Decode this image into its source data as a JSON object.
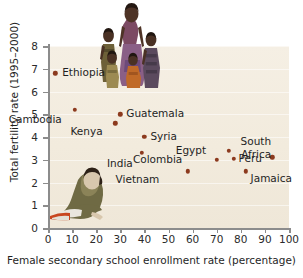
{
  "chart_data": {
    "type": "scatter",
    "title": "",
    "xlabel": "Female secondary school enrollment rate (percentage)",
    "ylabel": "Total fertility rate (1995–2000)",
    "xlim": [
      0,
      100
    ],
    "ylim": [
      0,
      8
    ],
    "xticks": [
      "0",
      "10",
      "20",
      "30",
      "40",
      "50",
      "60",
      "70",
      "80",
      "90",
      "100"
    ],
    "yticks": [
      "0",
      "1",
      "2",
      "3",
      "4",
      "5",
      "6",
      "7",
      "8"
    ],
    "grid": true,
    "legend": "none",
    "marker_color": "#8c3a1e",
    "plot_background": "#f3ece0",
    "points": [
      {
        "label": "Ethiopia",
        "x": 3,
        "y": 6.8,
        "label_dx": 7,
        "label_dy": -6
      },
      {
        "label": "Cambodia",
        "x": 11,
        "y": 5.2,
        "label_dx": -27,
        "label_dy": 4
      },
      {
        "label": "Guatemala",
        "x": 30,
        "y": 5.0,
        "label_dx": 6,
        "label_dy": -6
      },
      {
        "label": "Kenya",
        "x": 28,
        "y": 4.6,
        "label_dx": -23,
        "label_dy": 3
      },
      {
        "label": "Syria",
        "x": 40,
        "y": 4.0,
        "label_dx": 6,
        "label_dy": -6
      },
      {
        "label": "India",
        "x": 39,
        "y": 3.3,
        "label_dx": -13,
        "label_dy": 5
      },
      {
        "label": "Colombia",
        "x": 70,
        "y": 3.0,
        "label_dx": -45,
        "label_dy": -6
      },
      {
        "label": "Egypt",
        "x": 75,
        "y": 3.4,
        "label_dx": -31,
        "label_dy": -6
      },
      {
        "label": "Peru",
        "x": 77,
        "y": 3.05,
        "label_dx": 5,
        "label_dy": -6
      },
      {
        "label": "Vietnam",
        "x": 58,
        "y": 2.5,
        "label_dx": -39,
        "label_dy": 3
      },
      {
        "label": "Jamaica",
        "x": 82,
        "y": 2.5,
        "label_dx": 5,
        "label_dy": 2
      },
      {
        "label": "South Africa",
        "x": 93,
        "y": 3.1,
        "label_dx": -5,
        "label_dy": -22
      }
    ]
  },
  "illustrations": {
    "family": "family-of-five-illustration",
    "reader": "person-reading-book-illustration"
  }
}
